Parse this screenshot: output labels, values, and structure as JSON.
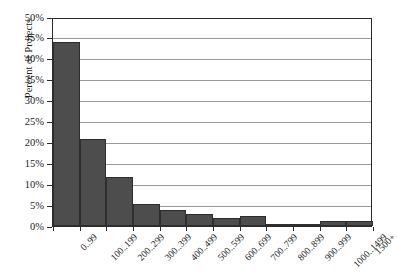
{
  "top_caption": "",
  "chart_data": {
    "type": "bar",
    "title": "",
    "xlabel": "",
    "ylabel": "Percent of Projects",
    "ylim": [
      0,
      50
    ],
    "ytick_step": 5,
    "ytick_labels": [
      "0%",
      "5%",
      "10%",
      "15%",
      "20%",
      "25%",
      "30%",
      "35%",
      "40%",
      "45%",
      "50%"
    ],
    "ytick_values": [
      0,
      5,
      10,
      15,
      20,
      25,
      30,
      35,
      40,
      45,
      50
    ],
    "grid": true,
    "legend": "none",
    "bar_color": "#4d4d4d",
    "bar_edge_color": "#2e2e2e",
    "axis_color": "#2b2b2b",
    "gridline_color": "#9a9a9a",
    "categories": [
      "0..99",
      "100..199",
      "200..299",
      "300..399",
      "400..499",
      "500..599",
      "600..699",
      "700..799",
      "800..899",
      "900..999",
      "1000..1499",
      "1500+"
    ],
    "values": [
      43.8,
      20.7,
      11.8,
      5.3,
      3.8,
      2.9,
      1.8,
      2.5,
      0.2,
      0.2,
      1.2,
      1.3
    ]
  }
}
